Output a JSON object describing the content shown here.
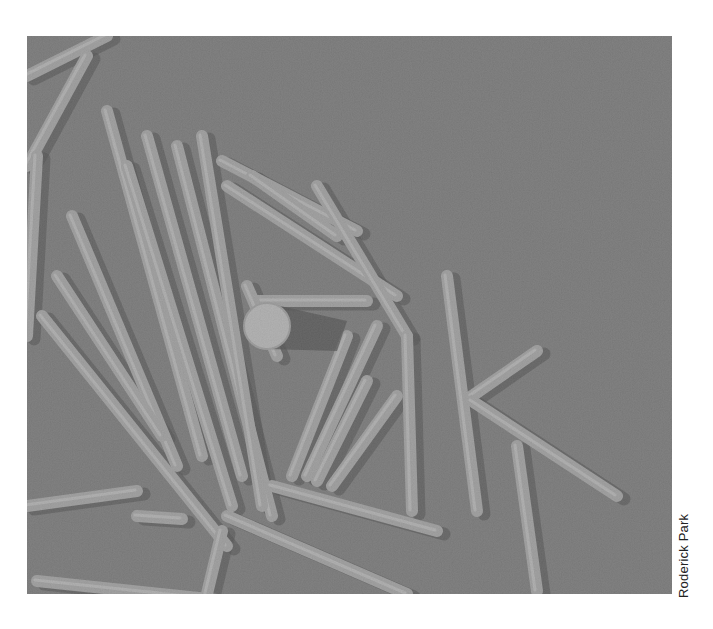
{
  "photo": {
    "description": "Grayscale electron micrograph of rod-shaped virus particles with a spherical reference particle",
    "background_color": "#8a8a8a",
    "rod_color": "#c4c4c4",
    "rod_highlight": "#e6e6e6",
    "shadow_color": "#4a4a4a",
    "sphere": {
      "cx": 240,
      "cy": 290,
      "r": 23,
      "color": "#e2e2e2"
    },
    "rods": [
      {
        "x1": 0,
        "y1": 40,
        "x2": 80,
        "y2": 0
      },
      {
        "x1": 0,
        "y1": 130,
        "x2": 60,
        "y2": 20
      },
      {
        "x1": 10,
        "y1": 120,
        "x2": 0,
        "y2": 300
      },
      {
        "x1": 80,
        "y1": 75,
        "x2": 175,
        "y2": 420
      },
      {
        "x1": 100,
        "y1": 130,
        "x2": 205,
        "y2": 470
      },
      {
        "x1": 120,
        "y1": 100,
        "x2": 215,
        "y2": 440
      },
      {
        "x1": 150,
        "y1": 110,
        "x2": 245,
        "y2": 480
      },
      {
        "x1": 45,
        "y1": 180,
        "x2": 150,
        "y2": 430
      },
      {
        "x1": 30,
        "y1": 240,
        "x2": 135,
        "y2": 400
      },
      {
        "x1": 15,
        "y1": 280,
        "x2": 200,
        "y2": 510
      },
      {
        "x1": 175,
        "y1": 100,
        "x2": 235,
        "y2": 470
      },
      {
        "x1": 200,
        "y1": 150,
        "x2": 370,
        "y2": 260
      },
      {
        "x1": 195,
        "y1": 125,
        "x2": 330,
        "y2": 195
      },
      {
        "x1": 225,
        "y1": 140,
        "x2": 310,
        "y2": 200
      },
      {
        "x1": 290,
        "y1": 150,
        "x2": 380,
        "y2": 300
      },
      {
        "x1": 380,
        "y1": 300,
        "x2": 385,
        "y2": 475
      },
      {
        "x1": 350,
        "y1": 290,
        "x2": 280,
        "y2": 440
      },
      {
        "x1": 320,
        "y1": 300,
        "x2": 265,
        "y2": 440
      },
      {
        "x1": 340,
        "y1": 345,
        "x2": 290,
        "y2": 445
      },
      {
        "x1": 370,
        "y1": 360,
        "x2": 305,
        "y2": 450
      },
      {
        "x1": 420,
        "y1": 240,
        "x2": 450,
        "y2": 475
      },
      {
        "x1": 445,
        "y1": 360,
        "x2": 510,
        "y2": 315
      },
      {
        "x1": 445,
        "y1": 365,
        "x2": 590,
        "y2": 460
      },
      {
        "x1": 490,
        "y1": 410,
        "x2": 510,
        "y2": 555
      },
      {
        "x1": 0,
        "y1": 470,
        "x2": 110,
        "y2": 455
      },
      {
        "x1": 10,
        "y1": 545,
        "x2": 200,
        "y2": 565
      },
      {
        "x1": 110,
        "y1": 480,
        "x2": 155,
        "y2": 483
      },
      {
        "x1": 245,
        "y1": 450,
        "x2": 410,
        "y2": 495
      },
      {
        "x1": 200,
        "y1": 480,
        "x2": 380,
        "y2": 558
      },
      {
        "x1": 195,
        "y1": 495,
        "x2": 180,
        "y2": 558
      },
      {
        "x1": 230,
        "y1": 265,
        "x2": 340,
        "y2": 265
      },
      {
        "x1": 220,
        "y1": 250,
        "x2": 250,
        "y2": 320
      }
    ]
  },
  "credit": {
    "text": "Roderick Park"
  }
}
